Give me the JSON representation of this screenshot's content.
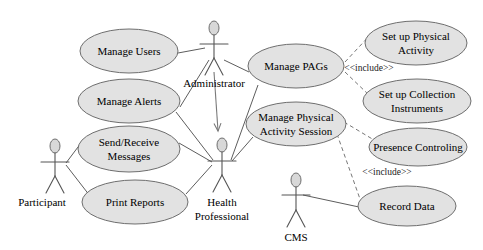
{
  "diagram": {
    "type": "uml-use-case-diagram",
    "title": "",
    "canvas": {
      "width": 483,
      "height": 250
    },
    "colors": {
      "ellipse_fill": "#e2e2e2",
      "ellipse_stroke": "#6e6e6e",
      "line": "#5d5d5d",
      "text": "#000000",
      "background": "#ffffff"
    }
  },
  "use_cases": [
    {
      "id": "manage_users",
      "label": "Manage Users",
      "lines": [
        "Manage Users"
      ],
      "cx": 129,
      "cy": 51,
      "rx": 49,
      "ry": 22
    },
    {
      "id": "manage_alerts",
      "label": "Manage Alerts",
      "lines": [
        "Manage Alerts"
      ],
      "cx": 129,
      "cy": 101,
      "rx": 51,
      "ry": 22
    },
    {
      "id": "send_receive",
      "label": "Send/Receive Messages",
      "lines": [
        "Send/Receive",
        "Messages"
      ],
      "cx": 129,
      "cy": 149,
      "rx": 51,
      "ry": 23
    },
    {
      "id": "print_reports",
      "label": "Print Reports",
      "lines": [
        "Print Reports"
      ],
      "cx": 135,
      "cy": 202,
      "rx": 53,
      "ry": 22
    },
    {
      "id": "manage_pags",
      "label": "Manage PAGs",
      "lines": [
        "Manage PAGs"
      ],
      "cx": 296,
      "cy": 66,
      "rx": 48,
      "ry": 22
    },
    {
      "id": "manage_pa_session",
      "label": "Manage Physical Activity Session",
      "lines": [
        "Manage Physical",
        "Activity Session"
      ],
      "cx": 296,
      "cy": 124,
      "rx": 50,
      "ry": 22
    },
    {
      "id": "setup_physical_activity",
      "label": "Set up Physical Activity",
      "lines": [
        "Set up Physical",
        "Activity"
      ],
      "cx": 416,
      "cy": 43,
      "rx": 51,
      "ry": 22
    },
    {
      "id": "setup_collection_instruments",
      "label": "Set up Collection Instruments",
      "lines": [
        "Set up Collection",
        "Instruments"
      ],
      "cx": 417,
      "cy": 101,
      "rx": 54,
      "ry": 22
    },
    {
      "id": "presence_controling",
      "label": "Presence Controling",
      "lines": [
        "Presence Controling"
      ],
      "cx": 418,
      "cy": 147,
      "rx": 49,
      "ry": 19
    },
    {
      "id": "record_data",
      "label": "Record Data",
      "lines": [
        "Record Data"
      ],
      "cx": 407,
      "cy": 206,
      "rx": 49,
      "ry": 20
    }
  ],
  "actors": [
    {
      "id": "participant",
      "label": "Participant",
      "lines": [
        "Participant"
      ],
      "x": 55,
      "y": 146
    },
    {
      "id": "administrator",
      "label": "Administrator",
      "lines": [
        "Administrator"
      ],
      "x": 214,
      "y": 28
    },
    {
      "id": "health_professional",
      "label": "Health Professional",
      "lines": [
        "Health",
        "Professional"
      ],
      "x": 222,
      "y": 145
    },
    {
      "id": "cms",
      "label": "CMS",
      "lines": [
        "CMS"
      ],
      "x": 296,
      "y": 180
    }
  ],
  "stereotypes": [
    {
      "id": "include_top",
      "label": "<<include>>",
      "x": 369,
      "y": 69
    },
    {
      "id": "include_bottom",
      "label": "<<include>>",
      "x": 387,
      "y": 173
    }
  ],
  "relationships": [
    {
      "from": "administrator",
      "to": "manage_users",
      "kind": "association"
    },
    {
      "from": "administrator",
      "to": "manage_alerts",
      "kind": "association"
    },
    {
      "from": "administrator",
      "to": "manage_pags",
      "kind": "association"
    },
    {
      "from": "administrator",
      "to": "health_professional",
      "kind": "generalization"
    },
    {
      "from": "participant",
      "to": "send_receive",
      "kind": "association"
    },
    {
      "from": "participant",
      "to": "print_reports",
      "kind": "association"
    },
    {
      "from": "health_professional",
      "to": "manage_alerts",
      "kind": "association"
    },
    {
      "from": "health_professional",
      "to": "send_receive",
      "kind": "association"
    },
    {
      "from": "health_professional",
      "to": "print_reports",
      "kind": "association"
    },
    {
      "from": "health_professional",
      "to": "manage_pags",
      "kind": "association"
    },
    {
      "from": "health_professional",
      "to": "manage_pa_session",
      "kind": "association"
    },
    {
      "from": "cms",
      "to": "record_data",
      "kind": "association"
    },
    {
      "from": "manage_pags",
      "to": "setup_physical_activity",
      "kind": "include"
    },
    {
      "from": "manage_pags",
      "to": "setup_collection_instruments",
      "kind": "include"
    },
    {
      "from": "manage_pa_session",
      "to": "presence_controling",
      "kind": "include"
    },
    {
      "from": "manage_pa_session",
      "to": "record_data",
      "kind": "include"
    }
  ]
}
